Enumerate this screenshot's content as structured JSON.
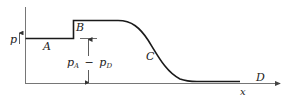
{
  "diagram": {
    "type": "pressure-profile",
    "colors": {
      "curve": "#1a1a1a",
      "axis": "#555555",
      "text": "#222222"
    },
    "labels": {
      "y_axis": "p",
      "x_axis": "x",
      "region_A": "A",
      "region_B": "B",
      "region_C": "C",
      "region_D": "D",
      "dimension_left": "p",
      "dimension_left_sub": "A",
      "dimension_op": "−",
      "dimension_right": "p",
      "dimension_right_sub": "D"
    }
  }
}
